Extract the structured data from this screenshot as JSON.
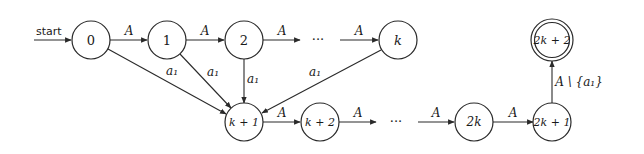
{
  "diagram": {
    "type": "finite-automaton",
    "start_label": "start",
    "ellipsis": "···",
    "nodes": [
      {
        "id": "0",
        "label": "0",
        "x": 91,
        "y": 40,
        "accepting": false
      },
      {
        "id": "1",
        "label": "1",
        "x": 167,
        "y": 40,
        "accepting": false
      },
      {
        "id": "2",
        "label": "2",
        "x": 244,
        "y": 40,
        "accepting": false
      },
      {
        "id": "k",
        "label": "k",
        "x": 398,
        "y": 40,
        "accepting": false
      },
      {
        "id": "k+1",
        "label": "k + 1",
        "x": 244,
        "y": 122,
        "accepting": false
      },
      {
        "id": "k+2",
        "label": "k + 2",
        "x": 320,
        "y": 122,
        "accepting": false
      },
      {
        "id": "2k",
        "label": "2k",
        "x": 474,
        "y": 122,
        "accepting": false
      },
      {
        "id": "2k+1",
        "label": "2k + 1",
        "x": 552,
        "y": 122,
        "accepting": false
      },
      {
        "id": "2k+2",
        "label": "2k + 2",
        "x": 552,
        "y": 40,
        "accepting": true
      }
    ],
    "edges": [
      {
        "from": "0",
        "to": "1",
        "label": "A"
      },
      {
        "from": "1",
        "to": "2",
        "label": "A"
      },
      {
        "from": "2",
        "to": "dots-top",
        "label": "A"
      },
      {
        "from": "dots-top",
        "to": "k",
        "label": "A"
      },
      {
        "from": "0",
        "to": "k+1",
        "label": "a₁"
      },
      {
        "from": "1",
        "to": "k+1",
        "label": "a₁"
      },
      {
        "from": "2",
        "to": "k+1",
        "label": "a₁"
      },
      {
        "from": "k",
        "to": "k+1",
        "label": "a₁"
      },
      {
        "from": "k+1",
        "to": "k+2",
        "label": "A"
      },
      {
        "from": "k+2",
        "to": "dots-bottom",
        "label": "A"
      },
      {
        "from": "dots-bottom",
        "to": "2k",
        "label": "A"
      },
      {
        "from": "2k",
        "to": "2k+1",
        "label": "A"
      },
      {
        "from": "2k+1",
        "to": "2k+2",
        "label": "A \\ {a₁}"
      }
    ]
  }
}
